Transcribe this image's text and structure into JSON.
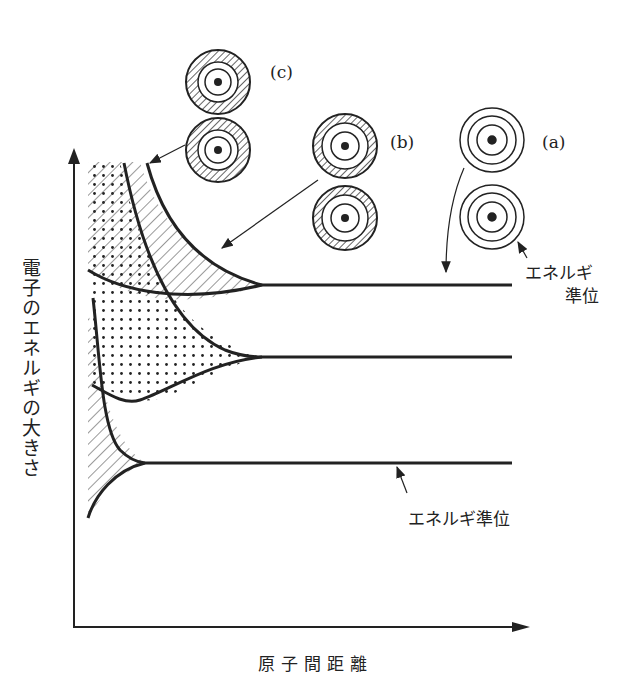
{
  "diagram": {
    "title": "",
    "type": "energy-band-formation",
    "axes": {
      "y_label": "電子のエネルギの大きさ",
      "x_label": "原子間距離"
    },
    "atom_pairs": [
      {
        "id": "a",
        "label": "(a)",
        "description": "isolated atoms, discrete energy levels"
      },
      {
        "id": "b",
        "label": "(b)",
        "description": "atoms closer, outer orbits overlap"
      },
      {
        "id": "c",
        "label": "(c)",
        "description": "atoms very close, orbits strongly overlap"
      }
    ],
    "annotations": {
      "energy_level_upper_line1": "エネルギ",
      "energy_level_upper_line2": "準位",
      "energy_level_lower": "エネルギ準位"
    },
    "levels": [
      {
        "name": "upper",
        "y": 285
      },
      {
        "name": "middle",
        "y": 357
      },
      {
        "name": "lower",
        "y": 463
      }
    ],
    "colors": {
      "ink": "#222222",
      "background": "#ffffff"
    }
  }
}
